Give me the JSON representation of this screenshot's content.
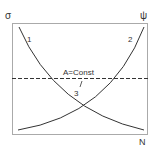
{
  "diagram": {
    "axis_left_label": "σ",
    "axis_right_label": "ψ",
    "axis_bottom_label": "N",
    "curves": [
      {
        "id": "1",
        "label": "1",
        "description": "decreasing curve"
      },
      {
        "id": "2",
        "label": "2",
        "description": "increasing curve"
      }
    ],
    "constant_line": {
      "label": "A=Const",
      "style": "dashed"
    },
    "intersection_label": "3",
    "colors": {
      "line": "#333333",
      "frame": "#999999"
    }
  }
}
